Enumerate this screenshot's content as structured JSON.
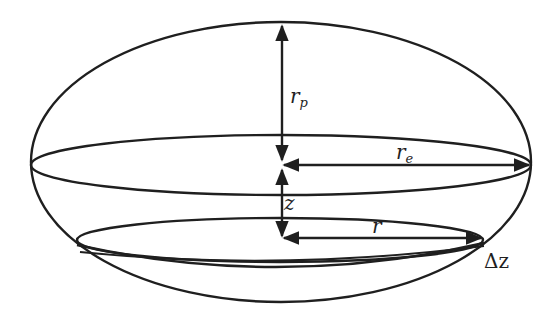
{
  "figure": {
    "labels": {
      "polar_radius": {
        "main": "r",
        "sub": "p"
      },
      "equatorial_radius": {
        "main": "r",
        "sub": "e"
      },
      "height": "z",
      "slice_radius": "r",
      "slice_thickness": "Δz"
    },
    "colors": {
      "line": "#1f1f1f",
      "background": "#ffffff"
    }
  }
}
